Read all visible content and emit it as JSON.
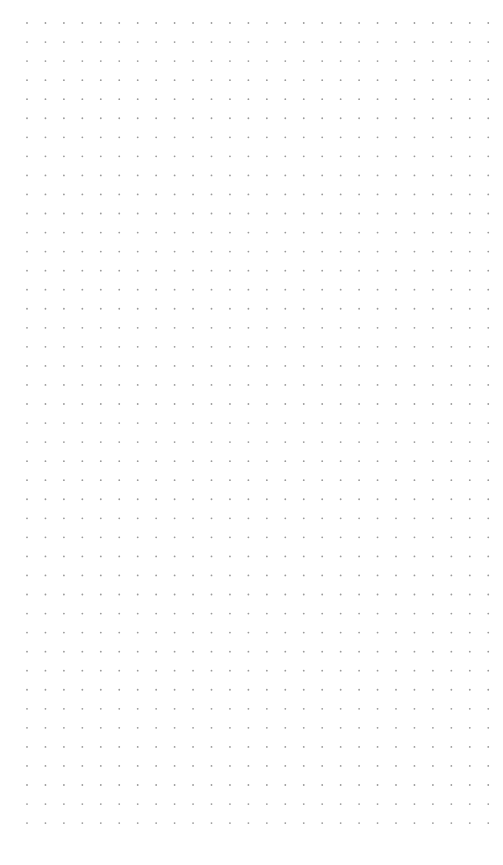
{
  "canvas": {
    "width": 503,
    "height": 865,
    "background": "#ffffff"
  },
  "dot_grid": {
    "columns": 26,
    "rows": 43,
    "origin_x": 27,
    "origin_y": 23,
    "step_x": 18.45,
    "step_y": 19.05,
    "dot_radius": 0.9,
    "dot_color": "#9a9a9a"
  }
}
